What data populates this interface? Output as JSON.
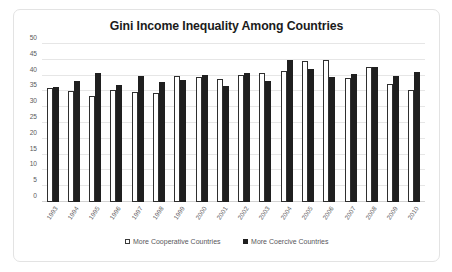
{
  "card": {
    "accent_color": "#1f1f1f",
    "border_color": "#e3e3e3"
  },
  "chart_data": {
    "type": "bar",
    "title": "Gini Income Inequality Among Countries",
    "xlabel": "",
    "ylabel": "",
    "ylim": [
      0,
      50
    ],
    "ytick_step": 5,
    "yticks": [
      "50",
      "45",
      "40",
      "35",
      "30",
      "25",
      "20",
      "15",
      "10",
      "5",
      "0"
    ],
    "grid": true,
    "legend_position": "bottom-center",
    "categories": [
      "1993",
      "1994",
      "1995",
      "1996",
      "1997",
      "1998",
      "1999",
      "2000",
      "2001",
      "2002",
      "2003",
      "2004",
      "2005",
      "2006",
      "2007",
      "2008",
      "2009",
      "2010"
    ],
    "series": [
      {
        "name": "More Cooperative Countries",
        "swatch": "coop",
        "color": "#ffffff",
        "values": [
          36.0,
          35.2,
          33.5,
          35.3,
          34.8,
          34.6,
          39.9,
          39.7,
          38.8,
          40.2,
          40.9,
          41.4,
          44.6,
          44.9,
          39.4,
          42.6,
          37.2,
          35.6
        ]
      },
      {
        "name": "More Coercive Countries",
        "swatch": "coer",
        "color": "#1f1f1f",
        "values": [
          36.5,
          38.2,
          40.8,
          37.0,
          39.8,
          37.9,
          38.6,
          40.3,
          36.7,
          40.8,
          38.3,
          45.0,
          42.2,
          39.5,
          40.6,
          42.8,
          39.8,
          41.1
        ]
      }
    ],
    "extra_pairs": {
      "note_visible_bars": 18
    }
  },
  "legend": [
    {
      "label": "More Cooperative Countries",
      "swatch": "coop"
    },
    {
      "label": "More Coercive Countries",
      "swatch": "coer"
    }
  ]
}
